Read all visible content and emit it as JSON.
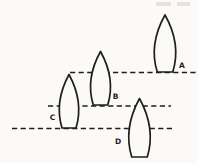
{
  "colors": {
    "paper": "#fbfaf6",
    "ink": "#1e1e1e",
    "artifact": "#d9d8d0"
  },
  "diagram": {
    "canvas": {
      "width": 198,
      "height": 163
    },
    "water_lines": [
      {
        "id": "water-line-1",
        "y": 72.5,
        "x1": 70,
        "x2": 196
      },
      {
        "id": "water-line-2",
        "y": 106,
        "x1": 48,
        "x2": 171
      },
      {
        "id": "water-line-3",
        "y": 128.5,
        "x1": 12,
        "x2": 172
      }
    ],
    "boats": [
      {
        "label": "A",
        "cx": 165,
        "top": 15,
        "bottom": 72,
        "width": 21,
        "label_x": 182,
        "label_y": 68
      },
      {
        "label": "B",
        "cx": 100.5,
        "top": 51.5,
        "bottom": 105,
        "width": 19.5,
        "label_x": 115.5,
        "label_y": 98.5
      },
      {
        "label": "C",
        "cx": 69,
        "top": 74.5,
        "bottom": 128,
        "width": 19,
        "label_x": 52.5,
        "label_y": 120
      },
      {
        "label": "D",
        "cx": 139.5,
        "top": 98.5,
        "bottom": 157,
        "width": 21,
        "label_x": 118,
        "label_y": 144
      }
    ],
    "artifact_marks": [
      {
        "x": 156,
        "y": 2,
        "width": 15,
        "height": 4
      },
      {
        "x": 177,
        "y": 2,
        "width": 13,
        "height": 4
      }
    ]
  }
}
